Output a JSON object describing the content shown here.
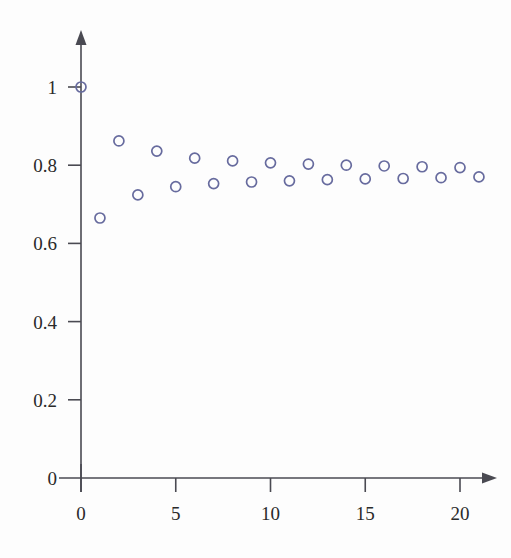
{
  "chart_data": {
    "type": "scatter",
    "title": "",
    "subtitle": "",
    "xlabel": "",
    "ylabel": "",
    "xlim": [
      0,
      22.6
    ],
    "ylim": [
      0,
      1.07
    ],
    "grid": false,
    "legend": "none",
    "marker": {
      "shape": "open-circle",
      "radius": 5,
      "stroke_color": "#676b9e",
      "stroke_width": 1.7,
      "fill": "none"
    },
    "axis_color": "#4a4a52",
    "x_ticks": [
      0,
      5,
      10,
      15,
      20
    ],
    "x_tick_labels": [
      "0",
      "5",
      "10",
      "15",
      "20"
    ],
    "y_ticks": [
      0,
      0.2,
      0.4,
      0.6,
      0.8,
      1
    ],
    "y_tick_labels": [
      "0",
      "0.2",
      "0.4",
      "0.6",
      "0.8",
      "1"
    ],
    "x": [
      0,
      1,
      2,
      3,
      4,
      5,
      6,
      7,
      8,
      9,
      10,
      11,
      12,
      13,
      14,
      15,
      16,
      17,
      18,
      19,
      20,
      21
    ],
    "y": [
      1.0,
      0.665,
      0.862,
      0.724,
      0.836,
      0.745,
      0.818,
      0.753,
      0.811,
      0.757,
      0.806,
      0.76,
      0.803,
      0.763,
      0.8,
      0.765,
      0.798,
      0.766,
      0.796,
      0.768,
      0.794,
      0.77
    ],
    "points": [
      {
        "x": 0,
        "y": 1.0
      },
      {
        "x": 1,
        "y": 0.665
      },
      {
        "x": 2,
        "y": 0.862
      },
      {
        "x": 3,
        "y": 0.724
      },
      {
        "x": 4,
        "y": 0.836
      },
      {
        "x": 5,
        "y": 0.745
      },
      {
        "x": 6,
        "y": 0.818
      },
      {
        "x": 7,
        "y": 0.753
      },
      {
        "x": 8,
        "y": 0.811
      },
      {
        "x": 9,
        "y": 0.757
      },
      {
        "x": 10,
        "y": 0.806
      },
      {
        "x": 11,
        "y": 0.76
      },
      {
        "x": 12,
        "y": 0.803
      },
      {
        "x": 13,
        "y": 0.763
      },
      {
        "x": 14,
        "y": 0.8
      },
      {
        "x": 15,
        "y": 0.765
      },
      {
        "x": 16,
        "y": 0.798
      },
      {
        "x": 17,
        "y": 0.766
      },
      {
        "x": 18,
        "y": 0.796
      },
      {
        "x": 19,
        "y": 0.768
      },
      {
        "x": 20,
        "y": 0.794
      },
      {
        "x": 21,
        "y": 0.77
      }
    ]
  },
  "geometry": {
    "origin_px": {
      "x": 81,
      "y": 478
    },
    "x_unit_px": 18.95,
    "y_unit_px": 391,
    "y_axis_top_px": 30,
    "x_axis_right_px": 497
  }
}
